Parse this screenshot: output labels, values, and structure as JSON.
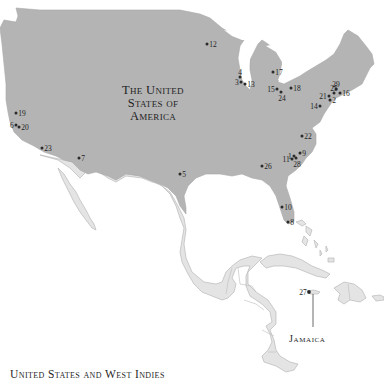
{
  "map": {
    "caption": "United States and West Indies",
    "country_label": {
      "line1": "The United",
      "line2": "States of",
      "line3": "America"
    },
    "callout_label": "Jamaica",
    "colors": {
      "highlight_country": "#b4b4b4",
      "other_land": "#e4e4e4",
      "water": "#ffffff",
      "marker": "#2b2b2b"
    },
    "markers": [
      {
        "id": "1",
        "label": "1",
        "x": 294,
        "y": 156,
        "label_side": "left"
      },
      {
        "id": "2",
        "label": "2",
        "x": 330,
        "y": 100,
        "label_side": "right"
      },
      {
        "id": "3",
        "label": "3",
        "x": 241,
        "y": 82,
        "label_side": "left"
      },
      {
        "id": "4",
        "label": "4",
        "x": 240,
        "y": 77,
        "label_side": "above"
      },
      {
        "id": "5",
        "label": "5",
        "x": 180,
        "y": 174,
        "label_side": "right"
      },
      {
        "id": "6",
        "label": "6",
        "x": 16,
        "y": 125,
        "label_side": "left"
      },
      {
        "id": "7",
        "label": "7",
        "x": 79,
        "y": 158,
        "label_side": "right"
      },
      {
        "id": "8",
        "label": "8",
        "x": 288,
        "y": 222,
        "label_side": "right"
      },
      {
        "id": "9",
        "label": "9",
        "x": 300,
        "y": 153,
        "label_side": "right"
      },
      {
        "id": "10",
        "label": "10",
        "x": 282,
        "y": 207,
        "label_side": "right"
      },
      {
        "id": "11",
        "label": "11",
        "x": 292,
        "y": 159,
        "label_side": "left"
      },
      {
        "id": "12",
        "label": "12",
        "x": 207,
        "y": 44,
        "label_side": "right"
      },
      {
        "id": "13",
        "label": "13",
        "x": 245,
        "y": 84,
        "label_side": "right"
      },
      {
        "id": "14",
        "label": "14",
        "x": 320,
        "y": 106,
        "label_side": "left"
      },
      {
        "id": "15",
        "label": "15",
        "x": 277,
        "y": 89,
        "label_side": "left"
      },
      {
        "id": "16",
        "label": "16",
        "x": 340,
        "y": 93,
        "label_side": "right"
      },
      {
        "id": "17",
        "label": "17",
        "x": 273,
        "y": 72,
        "label_side": "right"
      },
      {
        "id": "18",
        "label": "18",
        "x": 291,
        "y": 88,
        "label_side": "right"
      },
      {
        "id": "19",
        "label": "19",
        "x": 16,
        "y": 113,
        "label_side": "right"
      },
      {
        "id": "20",
        "label": "20",
        "x": 19,
        "y": 127,
        "label_side": "right"
      },
      {
        "id": "21",
        "label": "21",
        "x": 329,
        "y": 96,
        "label_side": "left"
      },
      {
        "id": "22",
        "label": "22",
        "x": 302,
        "y": 136,
        "label_side": "right"
      },
      {
        "id": "23",
        "label": "23",
        "x": 42,
        "y": 148,
        "label_side": "right"
      },
      {
        "id": "24",
        "label": "24",
        "x": 281,
        "y": 92,
        "label_side": "below"
      },
      {
        "id": "25",
        "label": "25",
        "x": 334,
        "y": 93,
        "label_side": "above"
      },
      {
        "id": "26",
        "label": "26",
        "x": 262,
        "y": 166,
        "label_side": "right"
      },
      {
        "id": "27",
        "label": "27",
        "x": 309,
        "y": 292,
        "label_side": "left"
      },
      {
        "id": "28",
        "label": "28",
        "x": 296,
        "y": 158,
        "label_side": "below"
      },
      {
        "id": "29",
        "label": "29",
        "x": 336,
        "y": 89,
        "label_side": "above"
      }
    ]
  }
}
